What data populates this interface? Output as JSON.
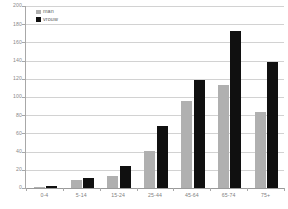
{
  "chart_data": {
    "type": "bar",
    "title": "",
    "xlabel": "",
    "ylabel": "",
    "ylim": [
      0,
      200
    ],
    "yticks": [
      0,
      20,
      40,
      60,
      80,
      100,
      120,
      140,
      160,
      180,
      200
    ],
    "grid": true,
    "legend_position": "top-left",
    "categories": [
      "0-4",
      "5-14",
      "15-24",
      "25-44",
      "45-64",
      "65-74",
      "75+"
    ],
    "series": [
      {
        "name": "man",
        "color": "#b0b0b0",
        "values": [
          1,
          9,
          13,
          41,
          96,
          113,
          84
        ]
      },
      {
        "name": "vrouw",
        "color": "#101010",
        "values": [
          2,
          11,
          24,
          68,
          119,
          172,
          138
        ]
      }
    ]
  },
  "legend": {
    "items": [
      {
        "label": "man"
      },
      {
        "label": "vrouw"
      }
    ]
  },
  "axis": {
    "y_tick_labels": [
      "200",
      "180",
      "160",
      "140",
      "120",
      "100",
      "80",
      "60",
      "40",
      "20",
      "0"
    ],
    "x_tick_labels": [
      "0-4",
      "5-14",
      "15-24",
      "25-44",
      "45-64",
      "65-74",
      "75+"
    ]
  }
}
